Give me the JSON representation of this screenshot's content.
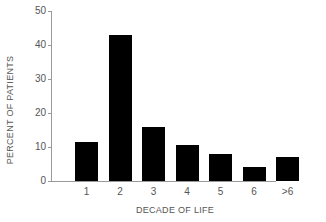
{
  "chart_data": {
    "type": "bar",
    "title": "",
    "xlabel": "DECADE OF LIFE",
    "ylabel": "PERCENT OF PATIENTS",
    "categories": [
      "1",
      "2",
      "3",
      "4",
      "5",
      "6",
      ">6"
    ],
    "values": [
      11.5,
      43,
      16,
      10.5,
      8,
      4,
      7
    ],
    "ylim": [
      0,
      50
    ],
    "yticks": [
      "0",
      "10",
      "20",
      "30",
      "40",
      "50"
    ],
    "grid": false,
    "legend": null,
    "bar_color": "#000000"
  }
}
